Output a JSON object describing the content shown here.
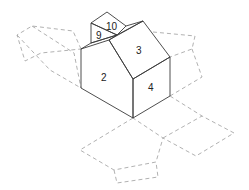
{
  "diagram": {
    "type": "isometric-house-unfolding-net",
    "faces": [
      {
        "id": "2",
        "label": "2",
        "x": 104,
        "y": 79
      },
      {
        "id": "3",
        "label": "3",
        "x": 139,
        "y": 52
      },
      {
        "id": "4",
        "label": "4",
        "x": 151,
        "y": 89
      },
      {
        "id": "9",
        "label": "9",
        "x": 99,
        "y": 37
      },
      {
        "id": "10",
        "label": "10",
        "x": 111,
        "y": 27
      }
    ],
    "colors": {
      "solid_edge": "#3a3a3a",
      "dashed_edge": "#a8a8a8",
      "background": "#ffffff"
    }
  }
}
